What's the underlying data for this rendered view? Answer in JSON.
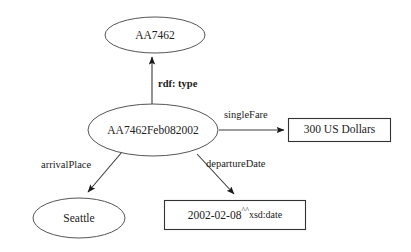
{
  "diagram": {
    "type": "rdf-graph",
    "title": "",
    "background_color": "#ffffff",
    "node_stroke_color": "#555555",
    "edge_color": "#3a3a3a",
    "text_color": "#222222",
    "nodes": [
      {
        "id": "class-node",
        "shape": "ellipse",
        "label": "AA7462",
        "cx": 155,
        "cy": 35,
        "rx": 50,
        "ry": 18
      },
      {
        "id": "resource-node",
        "shape": "ellipse",
        "label": "AA7462Feb082002",
        "cx": 153,
        "cy": 130,
        "rx": 65,
        "ry": 26
      },
      {
        "id": "arrival-place-node",
        "shape": "ellipse",
        "label": "Seattle",
        "cx": 79,
        "cy": 218,
        "rx": 46,
        "ry": 20
      },
      {
        "id": "single-fare-literal",
        "shape": "rect",
        "label": "300 US Dollars",
        "x": 288,
        "y": 118,
        "width": 102,
        "height": 23
      },
      {
        "id": "departure-date-literal",
        "shape": "rect",
        "label_main": "2002-02-08",
        "label_caret": "^^",
        "label_suffix": "xsd:date",
        "label_full": "2002-02-08^^xsd:date",
        "x": 164,
        "y": 200,
        "width": 141,
        "height": 29
      }
    ],
    "edges": [
      {
        "id": "edge-rdf-type",
        "label": "rdf: type",
        "bold": true,
        "from": "resource-node",
        "to": "class-node",
        "label_x": 158,
        "label_y": 85
      },
      {
        "id": "edge-single-fare",
        "label": "singleFare",
        "bold": false,
        "from": "resource-node",
        "to": "single-fare-literal",
        "label_x": 224,
        "label_y": 116
      },
      {
        "id": "edge-arrival-place",
        "label": "arrivalPlace",
        "bold": false,
        "from": "resource-node",
        "to": "arrival-place-node",
        "label_x": 41,
        "label_y": 166
      },
      {
        "id": "edge-departure-date",
        "label": "departureDate",
        "bold": false,
        "from": "resource-node",
        "to": "departure-date-literal",
        "label_x": 206,
        "label_y": 165
      }
    ]
  }
}
